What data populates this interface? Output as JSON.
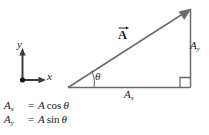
{
  "figure": {
    "background_color": "#ffffff",
    "line_color": "#555555",
    "text_color": "#1a1a1a"
  },
  "axes_widget": {
    "y_label": "y",
    "x_label": "x",
    "origin_marker": "origin-dot"
  },
  "triangle": {
    "vector_label": "A",
    "vector_arrow": "vector-overbar-arrow",
    "angle_label": "θ",
    "horizontal_component_label_base": "A",
    "horizontal_component_label_sub": "x",
    "vertical_component_label_base": "A",
    "vertical_component_label_sub": "y",
    "right_angle_marker": "right-angle-square"
  },
  "equations": [
    {
      "lhs_base": "A",
      "lhs_sub": "x",
      "equals": "=",
      "rhs_magnitude": "A",
      "rhs_function": "cos",
      "rhs_angle": "θ"
    },
    {
      "lhs_base": "A",
      "lhs_sub": "y",
      "equals": "=",
      "rhs_magnitude": "A",
      "rhs_function": "sin",
      "rhs_angle": "θ"
    }
  ]
}
